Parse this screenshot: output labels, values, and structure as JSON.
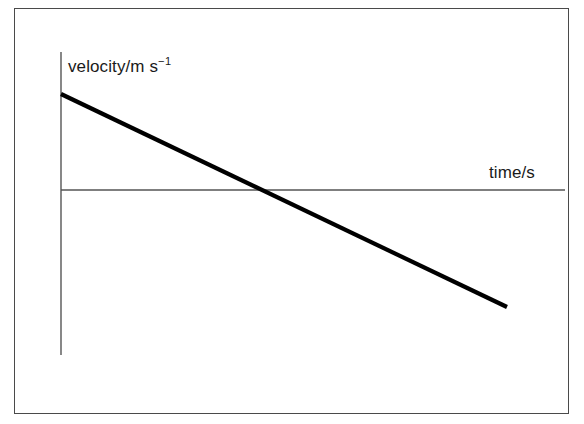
{
  "figure": {
    "background_color": "#ffffff",
    "border_color": "#4a4a4a",
    "axis_color": "#555555",
    "data_line_color": "#000000"
  },
  "labels": {
    "y_axis": "velocity/m s",
    "y_axis_exponent": "−1",
    "y_axis_full": "velocity/m s⁻¹",
    "x_axis": "time/s"
  },
  "chart_data": {
    "type": "line",
    "title": "",
    "subtitle": "",
    "xlabel": "time/s",
    "ylabel": "velocity/m s⁻¹",
    "grid": false,
    "legend": false,
    "legend_position": "none",
    "xlim": [
      0,
      10
    ],
    "ylim": [
      -3,
      3
    ],
    "xticks": [],
    "yticks": [],
    "xticklabels": [],
    "yticklabels": [],
    "annotations": [],
    "series": [
      {
        "name": "velocity",
        "style": "solid",
        "linewidth": 4,
        "color": "#000000",
        "x": [
          0,
          4.4,
          10
        ],
        "y": [
          1.9,
          0.0,
          -2.32
        ],
        "x_intercept": 4.4,
        "y_intercept": 1.9,
        "gradient": -0.43
      }
    ],
    "axes": {
      "x_axis_drawn_at_y": 0,
      "y_axis_drawn_at_x": 0,
      "x_axis_pixel": {
        "x1": 61,
        "y1": 190,
        "x2": 565,
        "y2": 190
      },
      "y_axis_pixel": {
        "x1": 61,
        "y1": 52,
        "x2": 61,
        "y2": 355
      },
      "data_line_pixel": {
        "x1": 61,
        "y1": 94,
        "x2": 507,
        "y2": 307
      }
    }
  }
}
